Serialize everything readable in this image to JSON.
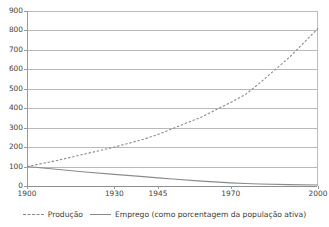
{
  "title": "",
  "chart_data": {
    "type": "line",
    "title": "",
    "xlabel": "",
    "ylabel": "",
    "ylim": [
      0,
      900
    ],
    "ytick_step": 100,
    "yticks": [
      900,
      800,
      700,
      600,
      500,
      400,
      300,
      200,
      100,
      0
    ],
    "categories": [
      "1900",
      "1930",
      "1945",
      "1970",
      "2000"
    ],
    "grid": "horizontal",
    "legend_position": "bottom",
    "series": [
      {
        "name": "Produção",
        "style": "dashed",
        "color": "#8a8a8a",
        "x": [
          1900,
          1910,
          1920,
          1930,
          1940,
          1945,
          1950,
          1960,
          1970,
          1975,
          1980,
          1990,
          2000
        ],
        "values": [
          100,
          130,
          165,
          200,
          240,
          265,
          295,
          355,
          430,
          470,
          530,
          660,
          810
        ]
      },
      {
        "name": "Emprego (como porcentagem da população ativa)",
        "style": "solid",
        "color": "#8a8a8a",
        "x": [
          1900,
          1910,
          1920,
          1930,
          1940,
          1945,
          1950,
          1960,
          1970,
          1975,
          1980,
          1990,
          2000
        ],
        "values": [
          100,
          86,
          72,
          60,
          48,
          42,
          36,
          25,
          16,
          13,
          10,
          7,
          5
        ]
      }
    ]
  },
  "axes": {
    "y_ticks": [
      "900",
      "800",
      "700",
      "600",
      "500",
      "400",
      "300",
      "200",
      "100",
      "0"
    ],
    "x_ticks": [
      "1900",
      "1930",
      "1945",
      "1970",
      "2000"
    ]
  },
  "legend": {
    "items": [
      {
        "label": "Produção",
        "style": "dashed"
      },
      {
        "label": "Emprego (como porcentagem da população ativa)",
        "style": "solid"
      }
    ]
  },
  "colors": {
    "grid": "#b9b9b9",
    "axis": "#9a9a9a",
    "series": "#8a8a8a",
    "text": "#3b3b3b",
    "background": "#ffffff"
  }
}
